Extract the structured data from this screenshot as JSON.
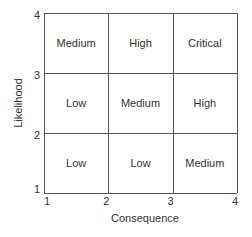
{
  "chart_data": {
    "type": "heatmap",
    "title": "",
    "xlabel": "Consequence",
    "ylabel": "Likelihood",
    "xlim": [
      1,
      4
    ],
    "ylim": [
      1,
      4
    ],
    "x_ticks": [
      "1",
      "2",
      "3",
      "4"
    ],
    "y_ticks": [
      "1",
      "2",
      "3",
      "4"
    ],
    "grid": true,
    "x_bounds": [
      1,
      2,
      3,
      4
    ],
    "y_bounds": [
      1,
      2,
      3,
      4
    ],
    "cells": [
      {
        "x": [
          1,
          2
        ],
        "y": [
          3,
          4
        ],
        "label": "Medium"
      },
      {
        "x": [
          2,
          3
        ],
        "y": [
          3,
          4
        ],
        "label": "High"
      },
      {
        "x": [
          3,
          4
        ],
        "y": [
          3,
          4
        ],
        "label": "Critical"
      },
      {
        "x": [
          1,
          2
        ],
        "y": [
          2,
          3
        ],
        "label": "Low"
      },
      {
        "x": [
          2,
          3
        ],
        "y": [
          2,
          3
        ],
        "label": "Medium"
      },
      {
        "x": [
          3,
          4
        ],
        "y": [
          2,
          3
        ],
        "label": "High"
      },
      {
        "x": [
          1,
          2
        ],
        "y": [
          1,
          2
        ],
        "label": "Low"
      },
      {
        "x": [
          2,
          3
        ],
        "y": [
          1,
          2
        ],
        "label": "Low"
      },
      {
        "x": [
          3,
          4
        ],
        "y": [
          1,
          2
        ],
        "label": "Medium"
      }
    ],
    "colors": {
      "line": "#555555",
      "text": "#333333"
    }
  }
}
